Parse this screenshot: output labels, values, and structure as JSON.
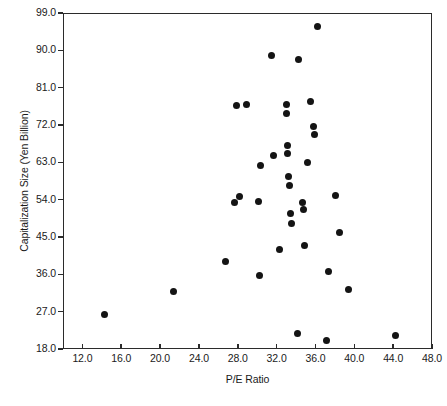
{
  "chart_data": {
    "type": "scatter",
    "title": "",
    "xlabel": "P/E Ratio",
    "ylabel": "Capitalization Size (Yen Billion)",
    "xlim": [
      10.0,
      48.0
    ],
    "ylim": [
      18.0,
      99.0
    ],
    "xticks": [
      "12.0",
      "16.0",
      "20.0",
      "24.0",
      "28.0",
      "32.0",
      "36.0",
      "40.0",
      "44.0",
      "48.0"
    ],
    "xtick_values": [
      12.0,
      16.0,
      20.0,
      24.0,
      28.0,
      32.0,
      36.0,
      40.0,
      44.0,
      48.0
    ],
    "yticks": [
      "18.0",
      "27.0",
      "36.0",
      "45.0",
      "54.0",
      "63.0",
      "72.0",
      "81.0",
      "90.0",
      "99.0"
    ],
    "ytick_values": [
      18.0,
      27.0,
      36.0,
      45.0,
      54.0,
      63.0,
      72.0,
      81.0,
      90.0,
      99.0
    ],
    "grid": false,
    "legend": "none",
    "marker": "filled-circle",
    "marker_color": "#141414",
    "frame_color": "#2b2b2b",
    "points": [
      {
        "x": 14.2,
        "y": 26.5
      },
      {
        "x": 21.3,
        "y": 32.0
      },
      {
        "x": 26.6,
        "y": 39.4
      },
      {
        "x": 27.6,
        "y": 53.6
      },
      {
        "x": 27.8,
        "y": 77.0
      },
      {
        "x": 28.1,
        "y": 55.0
      },
      {
        "x": 28.8,
        "y": 77.2
      },
      {
        "x": 30.0,
        "y": 53.8
      },
      {
        "x": 30.1,
        "y": 35.9
      },
      {
        "x": 30.2,
        "y": 62.4
      },
      {
        "x": 31.4,
        "y": 89.0
      },
      {
        "x": 31.6,
        "y": 65.0
      },
      {
        "x": 32.2,
        "y": 42.2
      },
      {
        "x": 32.9,
        "y": 77.2
      },
      {
        "x": 32.9,
        "y": 75.1
      },
      {
        "x": 33.0,
        "y": 67.2
      },
      {
        "x": 33.0,
        "y": 65.4
      },
      {
        "x": 33.1,
        "y": 59.8
      },
      {
        "x": 33.2,
        "y": 57.6
      },
      {
        "x": 33.3,
        "y": 51.0
      },
      {
        "x": 33.4,
        "y": 48.6
      },
      {
        "x": 34.0,
        "y": 21.9
      },
      {
        "x": 34.1,
        "y": 88.1
      },
      {
        "x": 34.6,
        "y": 53.6
      },
      {
        "x": 34.7,
        "y": 51.9
      },
      {
        "x": 34.8,
        "y": 43.3
      },
      {
        "x": 35.1,
        "y": 63.3
      },
      {
        "x": 35.4,
        "y": 78.0
      },
      {
        "x": 35.7,
        "y": 71.8
      },
      {
        "x": 35.8,
        "y": 69.9
      },
      {
        "x": 36.1,
        "y": 95.9
      },
      {
        "x": 37.0,
        "y": 20.3
      },
      {
        "x": 37.2,
        "y": 36.9
      },
      {
        "x": 38.0,
        "y": 55.2
      },
      {
        "x": 38.4,
        "y": 46.3
      },
      {
        "x": 39.3,
        "y": 32.6
      },
      {
        "x": 44.1,
        "y": 21.5
      }
    ]
  },
  "axis": {
    "x_title": "P/E Ratio",
    "y_title": "Capitalization Size (Yen Billion)"
  }
}
